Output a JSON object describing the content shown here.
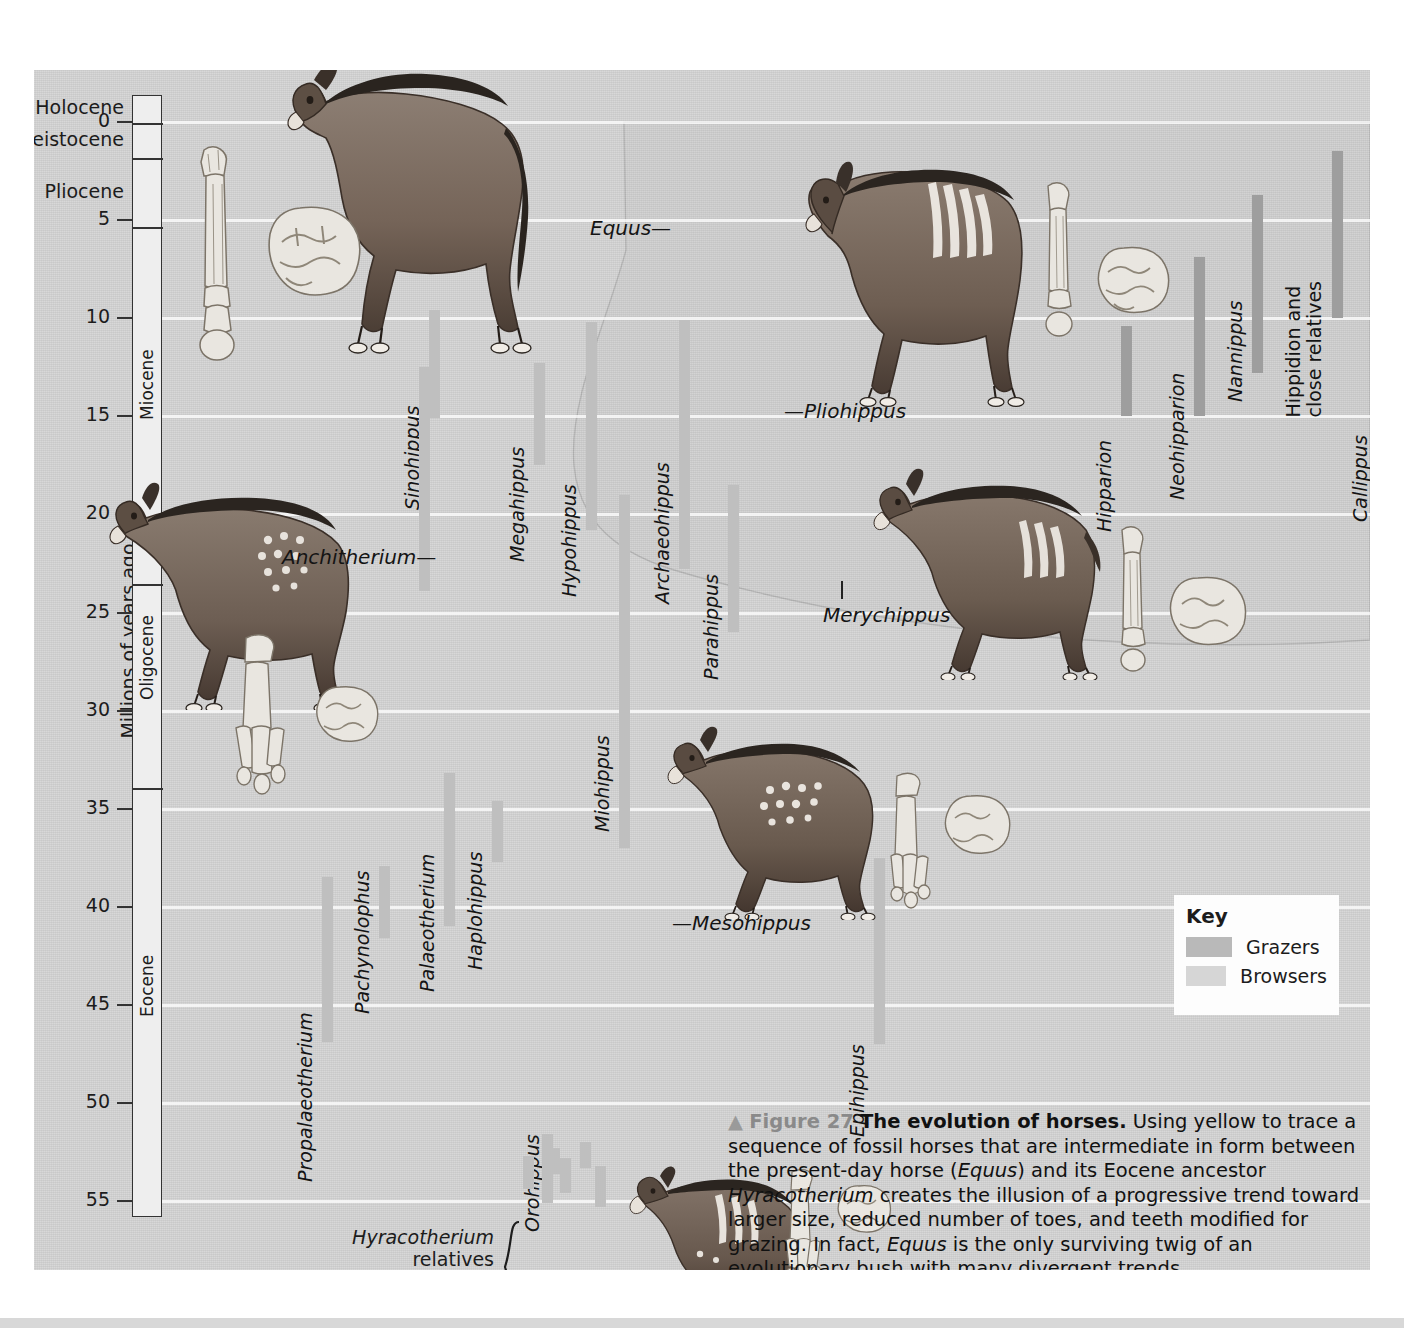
{
  "figure": {
    "number_prefix": "▲",
    "fig_label": "Figure 27",
    "title": "The evolution of horses.",
    "body_parts": [
      {
        "text": " Using yellow to trace a sequence of fossil horses that are intermediate in form between the present-day horse (",
        "italic": false
      },
      {
        "text": "Equus",
        "italic": true
      },
      {
        "text": ") and its Eocene ancestor ",
        "italic": false
      },
      {
        "text": "Hyracotherium",
        "italic": true
      },
      {
        "text": " creates the illusion of a progressive trend toward larger size, reduced number of toes, and teeth modified for grazing. In fact, ",
        "italic": false
      },
      {
        "text": "Equus",
        "italic": true
      },
      {
        "text": " is the only surviving twig of an evolutionary bush with many divergent trends.",
        "italic": false
      }
    ]
  },
  "axis": {
    "title": "Millions of years ago",
    "unit_max": 57.5,
    "ticks": [
      {
        "value": 0,
        "label": "0"
      },
      {
        "value": 5,
        "label": "5"
      },
      {
        "value": 10,
        "label": "10"
      },
      {
        "value": 15,
        "label": "15"
      },
      {
        "value": 20,
        "label": "20"
      },
      {
        "value": 25,
        "label": "25"
      },
      {
        "value": 30,
        "label": "30"
      },
      {
        "value": 35,
        "label": "35"
      },
      {
        "value": 40,
        "label": "40"
      },
      {
        "value": 45,
        "label": "45"
      },
      {
        "value": 50,
        "label": "50"
      },
      {
        "value": 55,
        "label": "55"
      }
    ],
    "gridlines": [
      0,
      5,
      10,
      15,
      20,
      25,
      30,
      35,
      40,
      45,
      50,
      55
    ]
  },
  "epochs": [
    {
      "name": "Holocene",
      "start": -1.4,
      "end": 0.0,
      "orient": "outside"
    },
    {
      "name": "Pleistocene",
      "start": 0.0,
      "end": 1.8,
      "orient": "outside"
    },
    {
      "name": "Pliocene",
      "start": 1.8,
      "end": 5.3,
      "orient": "outside"
    },
    {
      "name": "Miocene",
      "start": 5.3,
      "end": 23.5,
      "orient": "vertical"
    },
    {
      "name": "Oligocene",
      "start": 23.5,
      "end": 33.9,
      "orient": "vertical"
    },
    {
      "name": "Eocene",
      "start": 33.9,
      "end": 55.8,
      "orient": "vertical"
    }
  ],
  "key": {
    "title": "Key",
    "items": [
      {
        "label": "Grazers",
        "color": "#b9b9b9"
      },
      {
        "label": "Browsers",
        "color": "#d6d6d6"
      }
    ]
  },
  "colors": {
    "background": "#d4d4d4",
    "grazer_bar": "#9e9e9e",
    "browser_bar": "#bfbfbf",
    "gridline": "#ffffff",
    "text": "#141414"
  },
  "chart_data": {
    "type": "range-bar",
    "title": "The evolution of horses",
    "ylabel": "Millions of years ago",
    "ylim": [
      57.5,
      -1.4
    ],
    "y_inverted": true,
    "grid": true,
    "legend": [
      "Grazers",
      "Browsers"
    ],
    "note": "Horizontal position is arbitrary (taxon slot); vertical bars show temporal range in millions of years ago.",
    "taxa": [
      {
        "name": "Sinohippus",
        "x": 395,
        "from": 9.6,
        "to": 15.1,
        "type": "browser",
        "label_y": 418,
        "italic": true
      },
      {
        "name": "Megahippus",
        "x": 500,
        "from": 12.3,
        "to": 17.5,
        "type": "browser",
        "label_y": 470,
        "italic": true
      },
      {
        "name": "Hypohippus",
        "x": 552,
        "from": 10.2,
        "to": 20.8,
        "type": "browser",
        "label_y": 505,
        "italic": true
      },
      {
        "name": "Archaeohippus",
        "x": 645,
        "from": 10.1,
        "to": 22.8,
        "type": "browser",
        "label_y": 512,
        "italic": true
      },
      {
        "name": "Parahippus",
        "x": 694,
        "from": 18.5,
        "to": 26.0,
        "type": "browser",
        "label_y": 588,
        "italic": true
      },
      {
        "name": "Anchitherium",
        "x": 385,
        "from": 12.5,
        "to": 23.9,
        "type": "browser",
        "label_y": 0,
        "italic": true,
        "callout": true
      },
      {
        "name": "Miohippus",
        "x": 585,
        "from": 19.0,
        "to": 37.0,
        "type": "browser",
        "label_y": 740,
        "italic": true
      },
      {
        "name": "Hipparion",
        "x": 1087,
        "from": 10.4,
        "to": 15.0,
        "type": "grazer",
        "label_y": 440,
        "italic": true
      },
      {
        "name": "Neohipparion",
        "x": 1160,
        "from": 6.9,
        "to": 15.0,
        "type": "grazer",
        "label_y": 408,
        "italic": true
      },
      {
        "name": "Nannippus",
        "x": 1218,
        "from": 3.7,
        "to": 12.8,
        "type": "grazer",
        "label_y": 310,
        "italic": true
      },
      {
        "name": "Hippidion and close relatives",
        "x": 1298,
        "from": 1.5,
        "to": 10.0,
        "type": "grazer",
        "label_y": 305,
        "italic": false,
        "two_line": true
      },
      {
        "name": "Callippus",
        "x": 1343,
        "from": 4.5,
        "to": 15.2,
        "type": "grazer",
        "label_y": 430,
        "italic": true
      },
      {
        "name": "Propalaeotherium",
        "x": 288,
        "from": 38.5,
        "to": 46.9,
        "type": "browser",
        "label_y": 1090,
        "italic": true
      },
      {
        "name": "Pachynolophus",
        "x": 345,
        "from": 37.9,
        "to": 41.6,
        "type": "browser",
        "label_y": 922,
        "italic": true
      },
      {
        "name": "Palaeotherium",
        "x": 410,
        "from": 33.2,
        "to": 41.0,
        "type": "browser",
        "label_y": 900,
        "italic": true
      },
      {
        "name": "Haplohippus",
        "x": 458,
        "from": 34.6,
        "to": 37.7,
        "type": "browser",
        "label_y": 878,
        "italic": true
      },
      {
        "name": "Epihippus",
        "x": 840,
        "from": 37.5,
        "to": 47.0,
        "type": "browser",
        "label_y": 1045,
        "italic": true
      },
      {
        "name": "Orohippus",
        "x": 515,
        "from": 52.3,
        "to": 53.6,
        "type": "browser",
        "label_y": 1140,
        "italic": true
      }
    ],
    "hyracotherium_relatives": {
      "label_line1": "Hyracotherium",
      "label_line2": "relatives",
      "bars": [
        {
          "x": 489,
          "from": 52.7,
          "to": 54.4
        },
        {
          "x": 508,
          "from": 51.6,
          "to": 55.1
        },
        {
          "x": 526,
          "from": 52.8,
          "to": 54.6
        },
        {
          "x": 546,
          "from": 52.0,
          "to": 53.3
        },
        {
          "x": 561,
          "from": 53.2,
          "to": 55.3
        }
      ]
    },
    "callouts": [
      {
        "name": "Equus",
        "dash": "trailing",
        "x": 556,
        "y": 146
      },
      {
        "name": "Pliohippus",
        "dash": "leading",
        "x": 750,
        "y": 329
      },
      {
        "name": "Anchitherium",
        "dash": "trailing",
        "x": 248,
        "y": 475
      },
      {
        "name": "Merychippus",
        "dash": "tick",
        "x": 789,
        "y": 533
      },
      {
        "name": "Mesohippus",
        "dash": "leading",
        "x": 638,
        "y": 841
      },
      {
        "name": "Hyracotherium",
        "dash": "leading",
        "x": 638,
        "y": 1231
      }
    ]
  }
}
